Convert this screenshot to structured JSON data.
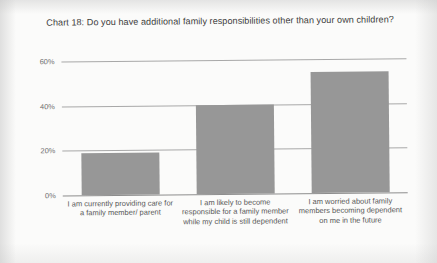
{
  "chart_data": {
    "type": "bar",
    "title": "Chart 18: Do you have additional family responsibilities other than your own children?",
    "categories": [
      "I am currently providing care for a family member/ parent",
      "I am likely to become responsible for a family member while my child is still dependent",
      "I am worried about family members becoming dependent on me in the future"
    ],
    "values": [
      19,
      40,
      54
    ],
    "xlabel": "",
    "ylabel": "",
    "ylim": [
      0,
      60
    ],
    "y_ticks": [
      0,
      20,
      40,
      60
    ],
    "y_tick_labels": [
      "0%",
      "20%",
      "40%",
      "60%"
    ],
    "grid": true,
    "legend": false,
    "bar_color": "#979797",
    "gridline_color": "#a8a8a8"
  },
  "chart": {
    "title": "Chart 18: Do you have additional family responsibilities other than your own children?",
    "y_axis": {
      "ticks": [
        {
          "label": "60%",
          "value": 60
        },
        {
          "label": "40%",
          "value": 40
        },
        {
          "label": "20%",
          "value": 20
        },
        {
          "label": "0%",
          "value": 0
        }
      ]
    },
    "bars": [
      {
        "label": "I am currently providing care for a family member/ parent",
        "value": 19
      },
      {
        "label": "I am likely to become responsible for a family member while my child is still dependent",
        "value": 40
      },
      {
        "label": "I am worried about family members becoming dependent on me in the future",
        "value": 54
      }
    ]
  }
}
